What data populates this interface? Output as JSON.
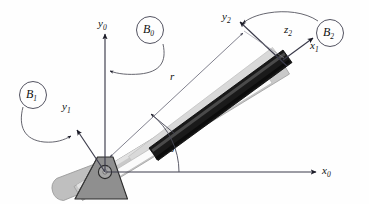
{
  "figure": {
    "type": "mechanism-diagram",
    "background_color": "#fefefe",
    "line_color": "#3a3a4a",
    "ink_color": "#111111"
  },
  "labels": {
    "y0": {
      "text": "y",
      "sub": "0"
    },
    "x0": {
      "text": "x",
      "sub": "0"
    },
    "y1": {
      "text": "y",
      "sub": "1"
    },
    "x1": {
      "text": "x",
      "sub": "1"
    },
    "y2": {
      "text": "y",
      "sub": "2"
    },
    "z2": {
      "text": "z",
      "sub": "2"
    },
    "B0": {
      "text": "B",
      "sub": "0"
    },
    "B1": {
      "text": "B",
      "sub": "1"
    },
    "B2": {
      "text": "B",
      "sub": "2"
    },
    "r": {
      "text": "r"
    },
    "theta": {
      "text": "θ"
    }
  },
  "bodies": {
    "base": {
      "name": "ground-pivot-base",
      "shape": "trapezoid",
      "fill": "#8f8f8f",
      "stroke": "#2b2b2b"
    },
    "pivot": {
      "name": "revolute-joint",
      "shape": "circle",
      "fill": "#a8a8a8",
      "stroke": "#2b2b2b"
    },
    "outer_tube": {
      "name": "prismatic-guide-channel",
      "fill": "#c9c9c9",
      "stroke": "#8a8a8a"
    },
    "tube_cap": {
      "name": "guide-channel-closed-end",
      "fill": "#bdbdbd",
      "stroke": "#8a8a8a"
    },
    "slider_rod": {
      "name": "sliding-rod",
      "fill": "#1a1a1a",
      "stroke": "#000000"
    },
    "rail_light": {
      "name": "rail-highlight",
      "fill": "#d8d8d8"
    }
  },
  "annotations": {
    "dimension_r": "r",
    "angle_theta": "θ",
    "frames": [
      "B0",
      "B1",
      "B2"
    ]
  }
}
